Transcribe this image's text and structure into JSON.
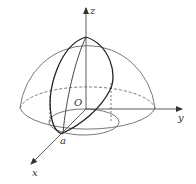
{
  "diagram": {
    "type": "3d-hemisphere-with-axes",
    "labels": {
      "z_axis": "z",
      "y_axis": "y",
      "x_axis": "x",
      "origin": "O",
      "point_a": "a"
    },
    "colors": {
      "stroke": "#333333",
      "background": "#ffffff"
    }
  }
}
